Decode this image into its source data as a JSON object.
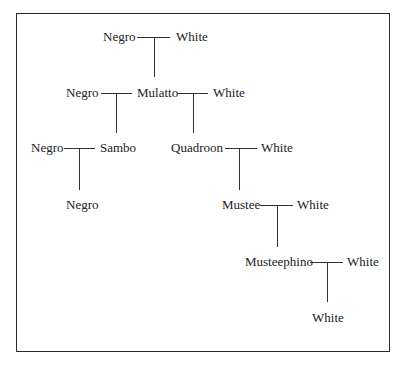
{
  "diagram": {
    "type": "genealogy-tree",
    "nodes": {
      "r1_left": "Negro",
      "r1_right": "White",
      "r2_left": "Negro",
      "r2_mid": "Mulatto",
      "r2_right": "White",
      "r3_left": "Negro",
      "r3_sambo": "Sambo",
      "r3_quadroon": "Quadroon",
      "r3_right": "White",
      "r4_negro": "Negro",
      "r4_mustee": "Mustee",
      "r4_right": "White",
      "r5_musteephino": "Musteephino",
      "r5_right": "White",
      "r6_white": "White"
    },
    "edges": [
      {
        "parents": [
          "Negro",
          "White"
        ],
        "child": "Mulatto"
      },
      {
        "parents": [
          "Negro",
          "Mulatto"
        ],
        "child": "Sambo"
      },
      {
        "parents": [
          "Mulatto",
          "White"
        ],
        "child": "Quadroon"
      },
      {
        "parents": [
          "Negro",
          "Sambo"
        ],
        "child": "Negro"
      },
      {
        "parents": [
          "Quadroon",
          "White"
        ],
        "child": "Mustee"
      },
      {
        "parents": [
          "Mustee",
          "White"
        ],
        "child": "Musteephino"
      },
      {
        "parents": [
          "Musteephino",
          "White"
        ],
        "child": "White"
      }
    ]
  },
  "colors": {
    "text": "#222222",
    "lines": "#333333",
    "border": "#2a2a2a",
    "background": "#ffffff"
  }
}
